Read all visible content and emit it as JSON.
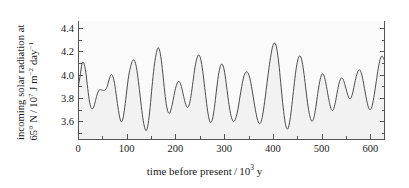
{
  "chart_data": {
    "type": "line",
    "title": "",
    "xlabel_text_before": "time before present / 10",
    "xlabel_exp": "3",
    "xlabel_text_after": " y",
    "ylabel_line1": "incoming solar radiation at",
    "ylabel_line2_before": "65° N / 10",
    "ylabel_line2_exp": "7",
    "ylabel_line2_after": " J m",
    "ylabel_line2_exp2": "−2",
    "ylabel_line2_after2": " day",
    "ylabel_line2_exp3": "−1",
    "xlabel": "time before present / 10^3 y",
    "ylabel": "incoming solar radiation at 65° N / 10^7 J m^-2 day^-1",
    "xlim": [
      0,
      630
    ],
    "ylim": [
      3.44,
      4.46
    ],
    "xticks": [
      0,
      100,
      200,
      300,
      400,
      500,
      600
    ],
    "xtick_labels": [
      "0",
      "100",
      "200",
      "300",
      "400",
      "500",
      "600"
    ],
    "xticks_minor": [
      50,
      150,
      250,
      350,
      450,
      550
    ],
    "yticks": [
      3.6,
      3.8,
      4.0,
      4.2,
      4.4
    ],
    "ytick_labels": [
      "3.6",
      "3.8",
      "4.0",
      "4.2",
      "4.4"
    ],
    "yticks_minor": [
      3.5,
      3.7,
      3.9,
      4.1,
      4.3
    ],
    "grid": false,
    "legend": null,
    "line_color": "#4d4d4d",
    "fill_color": "#fafafa",
    "axis_color": "#555555",
    "x": [
      0,
      4,
      8,
      12,
      16,
      20,
      24,
      28,
      32,
      36,
      40,
      44,
      48,
      52,
      56,
      60,
      64,
      68,
      72,
      76,
      80,
      84,
      88,
      92,
      96,
      100,
      104,
      108,
      112,
      116,
      120,
      124,
      128,
      132,
      136,
      140,
      144,
      148,
      152,
      156,
      160,
      164,
      168,
      172,
      176,
      180,
      184,
      188,
      192,
      196,
      200,
      204,
      208,
      212,
      216,
      220,
      224,
      228,
      232,
      236,
      240,
      244,
      248,
      252,
      256,
      260,
      264,
      268,
      272,
      276,
      280,
      284,
      288,
      292,
      296,
      300,
      304,
      308,
      312,
      316,
      320,
      324,
      328,
      332,
      336,
      340,
      344,
      348,
      352,
      356,
      360,
      364,
      368,
      372,
      376,
      380,
      384,
      388,
      392,
      396,
      400,
      404,
      408,
      412,
      416,
      420,
      424,
      428,
      432,
      436,
      440,
      444,
      448,
      452,
      456,
      460,
      464,
      468,
      472,
      476,
      480,
      484,
      488,
      492,
      496,
      500,
      504,
      508,
      512,
      516,
      520,
      524,
      528,
      532,
      536,
      540,
      544,
      548,
      552,
      556,
      560,
      564,
      568,
      572,
      576,
      580,
      584,
      588,
      592,
      596,
      600,
      604,
      608,
      612,
      616,
      620,
      624,
      628
    ],
    "y": [
      3.885,
      3.98,
      4.09,
      4.1,
      4.02,
      3.88,
      3.76,
      3.71,
      3.72,
      3.78,
      3.84,
      3.87,
      3.87,
      3.865,
      3.87,
      3.9,
      3.96,
      4.0,
      3.98,
      3.9,
      3.78,
      3.67,
      3.6,
      3.62,
      3.72,
      3.86,
      3.99,
      4.07,
      4.12,
      4.12,
      4.06,
      3.94,
      3.8,
      3.66,
      3.56,
      3.52,
      3.58,
      3.72,
      3.9,
      4.06,
      4.17,
      4.23,
      4.2,
      4.09,
      3.93,
      3.78,
      3.69,
      3.67,
      3.72,
      3.8,
      3.88,
      3.93,
      3.94,
      3.9,
      3.83,
      3.76,
      3.72,
      3.74,
      3.82,
      3.94,
      4.06,
      4.14,
      4.17,
      4.13,
      4.03,
      3.89,
      3.75,
      3.64,
      3.59,
      3.62,
      3.72,
      3.86,
      3.99,
      4.07,
      4.09,
      4.04,
      3.93,
      3.8,
      3.69,
      3.62,
      3.6,
      3.63,
      3.7,
      3.8,
      3.9,
      3.98,
      4.02,
      4.02,
      3.98,
      3.9,
      3.8,
      3.7,
      3.62,
      3.58,
      3.6,
      3.68,
      3.8,
      3.93,
      4.06,
      4.17,
      4.25,
      4.27,
      4.22,
      4.1,
      3.93,
      3.76,
      3.62,
      3.54,
      3.55,
      3.64,
      3.78,
      3.93,
      4.06,
      4.14,
      4.16,
      4.11,
      4.0,
      3.86,
      3.73,
      3.64,
      3.6,
      3.63,
      3.72,
      3.84,
      3.94,
      4.0,
      4.0,
      3.94,
      3.85,
      3.76,
      3.7,
      3.7,
      3.76,
      3.85,
      3.93,
      3.97,
      3.96,
      3.91,
      3.85,
      3.8,
      3.8,
      3.85,
      3.93,
      4.0,
      4.04,
      4.03,
      3.97,
      3.88,
      3.79,
      3.72,
      3.7,
      3.74,
      3.83,
      3.94,
      4.05,
      4.13,
      4.16,
      4.13
    ]
  }
}
